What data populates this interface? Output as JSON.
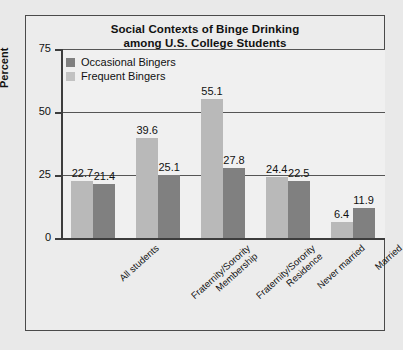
{
  "chart_data": {
    "type": "bar",
    "title": "Social Contexts of Binge Drinking among U.S. College Students",
    "title_line1": "Social Contexts of Binge Drinking",
    "title_line2": "among U.S. College Students",
    "xlabel": "",
    "ylabel": "Percent",
    "ylim": [
      0,
      75
    ],
    "yticks": [
      0,
      25,
      50,
      75
    ],
    "ytick_labels": [
      "0",
      "25",
      "50",
      "75"
    ],
    "grid": true,
    "legend_position": "top-left",
    "categories": [
      "All students",
      "Fraternity/Sorority Membership",
      "Fraternity/Sorority Residence",
      "Never married",
      "Married"
    ],
    "category_lines": [
      [
        "All students"
      ],
      [
        "Fraternity/Sorority",
        "Membership"
      ],
      [
        "Fraternity/Sorority",
        "Residence"
      ],
      [
        "Never married"
      ],
      [
        "Married"
      ]
    ],
    "series": [
      {
        "name": "Occasional Bingers",
        "color": "#b9b9b9",
        "values": [
          22.7,
          39.6,
          55.1,
          24.4,
          6.4
        ],
        "labels": [
          "22.7",
          "39.6",
          "55.1",
          "24.4",
          "6.4"
        ]
      },
      {
        "name": "Frequent Bingers",
        "color": "#808080",
        "values": [
          21.4,
          25.1,
          27.8,
          22.5,
          11.9
        ],
        "labels": [
          "21.4",
          "25.1",
          "27.8",
          "22.5",
          "11.9"
        ]
      }
    ]
  },
  "legend": {
    "items": [
      {
        "label": "Occasional Bingers",
        "swatch": "dark"
      },
      {
        "label": "Frequent Bingers",
        "swatch": "light"
      }
    ]
  }
}
